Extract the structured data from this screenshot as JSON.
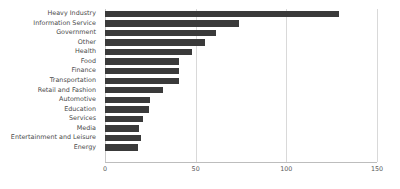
{
  "chart_data": {
    "type": "bar",
    "orientation": "horizontal",
    "title": "",
    "xlabel": "",
    "ylabel": "",
    "xlim": [
      0,
      150
    ],
    "ylim": null,
    "grid": true,
    "legend": null,
    "bar_color": "#3a3a3a",
    "xticks": [
      0,
      50,
      100,
      150
    ],
    "xtick_labels": [
      "0",
      "50",
      "100",
      "150"
    ],
    "categories": [
      "Heavy Industry",
      "Information Service",
      "Government",
      "Other",
      "Health",
      "Food",
      "Finance",
      "Transportation",
      "Retail and Fashion",
      "Automotive",
      "Education",
      "Services",
      "Media",
      "Entertainment and Leisure",
      "Energy"
    ],
    "values": [
      129,
      74,
      61,
      55,
      48,
      41,
      41,
      41,
      32,
      25,
      24,
      21,
      19,
      20,
      18
    ]
  }
}
